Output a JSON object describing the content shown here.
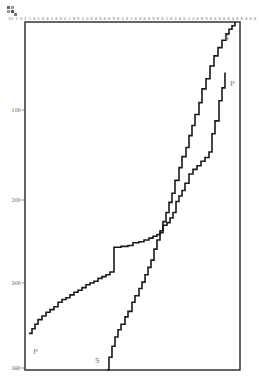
{
  "figure": {
    "top_ruler_text": "30 3 9 4 1 8 1 8 8 4 8 8 0 1 8 5 4 0 8 8 8 8 8 5 8 4 8 3 8 8 8 8 5 8 8 3 8 4 8 8 4 0 8 8 5 8 8 8 8 8 6 8 8 8 8 8 8 8 8 8 8 8 8 4 5 8 1 8 8 8 8 7 8 8 8 8 8 8 8 8 8 8 8 8 8 8 8 8 8 3 8 - 1 7",
    "y_ticks": [
      "100",
      "200",
      "300",
      "380"
    ]
  },
  "chart_data": {
    "type": "line",
    "title": "",
    "xlabel": "",
    "ylabel": "",
    "y_axis_inverted": true,
    "ylim": [
      0,
      380
    ],
    "y_tick_labels": [
      "100",
      "200",
      "300",
      "380"
    ],
    "grid": false,
    "legend": "inline labels at curve ends",
    "series": [
      {
        "name": "P",
        "style": "step",
        "label_position": "lower-left and upper-right",
        "points": [
          [
            0,
            340
          ],
          [
            3,
            335
          ],
          [
            6,
            330
          ],
          [
            9,
            325
          ],
          [
            13,
            321
          ],
          [
            17,
            317
          ],
          [
            21,
            314
          ],
          [
            25,
            311
          ],
          [
            29,
            306
          ],
          [
            33,
            303
          ],
          [
            37,
            301
          ],
          [
            41,
            298
          ],
          [
            45,
            295
          ],
          [
            49,
            293
          ],
          [
            53,
            290
          ],
          [
            57,
            287
          ],
          [
            61,
            285
          ],
          [
            65,
            283
          ],
          [
            69,
            280
          ],
          [
            73,
            278
          ],
          [
            77,
            276
          ],
          [
            81,
            273
          ],
          [
            85,
            270
          ],
          [
            85,
            246
          ],
          [
            92,
            245
          ],
          [
            99,
            244
          ],
          [
            104,
            241
          ],
          [
            110,
            240
          ],
          [
            115,
            238
          ],
          [
            120,
            236
          ],
          [
            124,
            234
          ],
          [
            128,
            232
          ],
          [
            131,
            230
          ],
          [
            134,
            222
          ],
          [
            138,
            219
          ],
          [
            141,
            214
          ],
          [
            144,
            208
          ],
          [
            147,
            196
          ],
          [
            150,
            190
          ],
          [
            153,
            184
          ],
          [
            156,
            176
          ],
          [
            160,
            166
          ],
          [
            164,
            161
          ],
          [
            168,
            157
          ],
          [
            172,
            152
          ],
          [
            176,
            148
          ],
          [
            180,
            142
          ],
          [
            183,
            122
          ],
          [
            186,
            108
          ],
          [
            190,
            86
          ],
          [
            193,
            72
          ],
          [
            196,
            55
          ]
        ]
      },
      {
        "name": "S",
        "style": "step",
        "label_position": "lower-left and upper-right",
        "points": [
          [
            78,
            380
          ],
          [
            80,
            366
          ],
          [
            83,
            354
          ],
          [
            86,
            344
          ],
          [
            89,
            336
          ],
          [
            92,
            330
          ],
          [
            96,
            322
          ],
          [
            99,
            316
          ],
          [
            103,
            306
          ],
          [
            106,
            299
          ],
          [
            110,
            291
          ],
          [
            113,
            284
          ],
          [
            116,
            276
          ],
          [
            119,
            268
          ],
          [
            122,
            260
          ],
          [
            125,
            248
          ],
          [
            128,
            238
          ],
          [
            131,
            228
          ],
          [
            134,
            218
          ],
          [
            137,
            208
          ],
          [
            140,
            197
          ],
          [
            143,
            187
          ],
          [
            146,
            173
          ],
          [
            150,
            159
          ],
          [
            153,
            147
          ],
          [
            157,
            137
          ],
          [
            160,
            124
          ],
          [
            163,
            113
          ],
          [
            166,
            101
          ],
          [
            170,
            88
          ],
          [
            173,
            73
          ],
          [
            177,
            62
          ],
          [
            181,
            48
          ],
          [
            185,
            37
          ],
          [
            189,
            28
          ],
          [
            193,
            20
          ],
          [
            197,
            13
          ],
          [
            200,
            8
          ],
          [
            203,
            4
          ],
          [
            206,
            0
          ]
        ]
      }
    ]
  }
}
